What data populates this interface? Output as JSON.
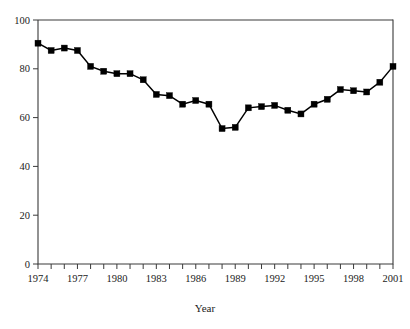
{
  "caption": {
    "clipped_text": " "
  },
  "axes": {
    "x_title": "Year",
    "y_title": "",
    "y_ticks": [
      0,
      20,
      40,
      60,
      80,
      100
    ],
    "x_tick_labels": [
      "1974",
      "1977",
      "1980",
      "1983",
      "1986",
      "1989",
      "1992",
      "1995",
      "1998",
      "2001"
    ],
    "x_label_years": [
      1974,
      1977,
      1980,
      1983,
      1986,
      1989,
      1992,
      1995,
      1998,
      2001
    ]
  },
  "style": {
    "line_color": "#000000",
    "marker_color": "#000000",
    "axis_color": "#3a3a3a",
    "background": "#ffffff",
    "marker_shape": "square",
    "marker_size": 6
  },
  "chart_data": {
    "type": "line",
    "title": "",
    "subtitle": "",
    "xlabel": "Year",
    "ylabel": "",
    "xlim": [
      1974,
      2001
    ],
    "ylim": [
      0,
      100
    ],
    "grid": false,
    "legend": false,
    "legend_position": "none",
    "x": [
      1974,
      1975,
      1976,
      1977,
      1978,
      1979,
      1980,
      1981,
      1982,
      1983,
      1984,
      1985,
      1986,
      1987,
      1988,
      1989,
      1990,
      1991,
      1992,
      1993,
      1994,
      1995,
      1996,
      1997,
      1998,
      1999,
      2000,
      2001
    ],
    "categories": [
      "1974",
      "1975",
      "1976",
      "1977",
      "1978",
      "1979",
      "1980",
      "1981",
      "1982",
      "1983",
      "1984",
      "1985",
      "1986",
      "1987",
      "1988",
      "1989",
      "1990",
      "1991",
      "1992",
      "1993",
      "1994",
      "1995",
      "1996",
      "1997",
      "1998",
      "1999",
      "2000",
      "2001"
    ],
    "series": [
      {
        "name": "series-1",
        "values": [
          90.5,
          87.5,
          88.5,
          87.5,
          81.0,
          79.0,
          78.0,
          78.0,
          75.5,
          69.5,
          69.0,
          65.5,
          67.0,
          65.5,
          55.5,
          56.0,
          64.0,
          64.5,
          65.0,
          63.0,
          61.5,
          65.5,
          67.5,
          71.5,
          71.0,
          70.5,
          74.5,
          81.0
        ]
      }
    ],
    "values": [
      90.5,
      87.5,
      88.5,
      87.5,
      81.0,
      79.0,
      78.0,
      78.0,
      75.5,
      69.5,
      69.0,
      65.5,
      67.0,
      65.5,
      55.5,
      56.0,
      64.0,
      64.5,
      65.0,
      63.0,
      61.5,
      65.5,
      67.5,
      71.5,
      71.0,
      70.5,
      74.5,
      81.0
    ]
  }
}
